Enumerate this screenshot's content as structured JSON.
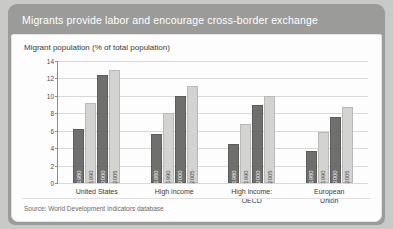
{
  "figure": {
    "title": "Migrants provide labor and encourage cross-border exchange",
    "source": "Source: World Development Indicators database",
    "colors": {
      "header_band": "#9b9b99",
      "panel": "#fdfdfd",
      "bar_dark": "#6f6f6d",
      "bar_light": "#d3d3d1",
      "grid": "#d8d8d6",
      "axis": "#8d8d8b"
    }
  },
  "chart_data": {
    "type": "bar",
    "title": "Migrant population (% of total population)",
    "xlabel": "",
    "ylabel": "",
    "ylim": [
      0,
      14
    ],
    "yticks": [
      0,
      2,
      4,
      6,
      8,
      10,
      12,
      14
    ],
    "grid": true,
    "legend_position": "none",
    "categories": [
      "United States",
      "High income",
      "High income: OECD",
      "European Union"
    ],
    "category_lines": [
      [
        "United States"
      ],
      [
        "High income"
      ],
      [
        "High income:",
        "OECD"
      ],
      [
        "European",
        "Union"
      ]
    ],
    "series": [
      {
        "name": "1980",
        "values": [
          6.2,
          5.6,
          4.5,
          3.7
        ]
      },
      {
        "name": "1990",
        "values": [
          9.2,
          8.0,
          6.8,
          5.8
        ]
      },
      {
        "name": "2000",
        "values": [
          12.4,
          10.0,
          8.9,
          7.6
        ]
      },
      {
        "name": "2005",
        "values": [
          13.0,
          11.1,
          10.0,
          8.7
        ]
      }
    ],
    "bar_labels_inside": [
      "1980",
      "1990",
      "2000",
      "2005"
    ]
  }
}
